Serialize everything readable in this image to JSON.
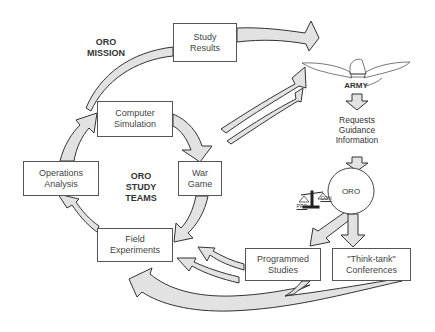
{
  "title": "ORO MISSION",
  "center_label": "ORO\nSTUDY\nTEAMS",
  "boxes": {
    "study_results": "Study\nResults",
    "computer_simulation": "Computer\nSimulation",
    "operations_analysis": "Operations\nAnalysis",
    "war_game": "War\nGame",
    "field_experiments": "Field\nExperiments",
    "programmed_studies": "Programmed\nStudies",
    "think_tank": "\"Think-tank\"\nConferences"
  },
  "army": {
    "label": "ARMY",
    "icon": "eagle-icon",
    "requests": "Requests\nGuidance\nInformation"
  },
  "oro_node": {
    "label": "ORO",
    "scales_icon": "balance-scales-icon",
    "pro": "PRO",
    "con": "CON"
  },
  "colors": {
    "arrow_fill": "#e2e2e2",
    "stroke": "#333333",
    "box_border": "#555555"
  }
}
